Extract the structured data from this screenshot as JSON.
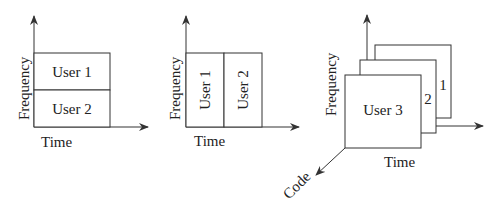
{
  "diagrams": [
    {
      "name": "fdma",
      "y_axis_label": "Frequency",
      "x_axis_label": "Time",
      "cells": [
        {
          "label": "User 1"
        },
        {
          "label": "User 2"
        }
      ]
    },
    {
      "name": "tdma",
      "y_axis_label": "Frequency",
      "x_axis_label": "Time",
      "cells": [
        {
          "label": "User 1"
        },
        {
          "label": "User 2"
        }
      ]
    },
    {
      "name": "cdma",
      "y_axis_label": "Frequency",
      "x_axis_label": "Time",
      "z_axis_label": "Code",
      "cells": [
        {
          "label": "User 3"
        },
        {
          "label": "2"
        },
        {
          "label": "1"
        }
      ]
    }
  ],
  "colors": {
    "stroke": "#333333",
    "text": "#222222",
    "background": "#ffffff"
  }
}
